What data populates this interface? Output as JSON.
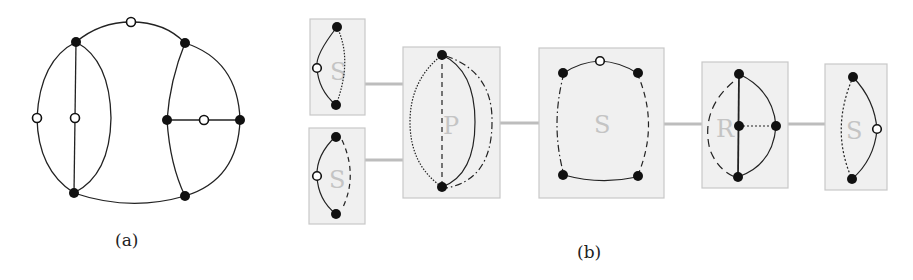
{
  "captions": {
    "a": "(a)",
    "b": "(b)"
  },
  "panel_b": {
    "nodes": [
      {
        "type": "S",
        "label": "S"
      },
      {
        "type": "S",
        "label": "S"
      },
      {
        "type": "P",
        "label": "P"
      },
      {
        "type": "S",
        "label": "S"
      },
      {
        "type": "R",
        "label": "R"
      },
      {
        "type": "S",
        "label": "S"
      }
    ]
  },
  "colors": {
    "box_fill": "#f0f0f0",
    "box_stroke": "#c8c8c8",
    "connector": "#bdbdbd",
    "label": "#c4c4c4",
    "edge": "#222222"
  }
}
